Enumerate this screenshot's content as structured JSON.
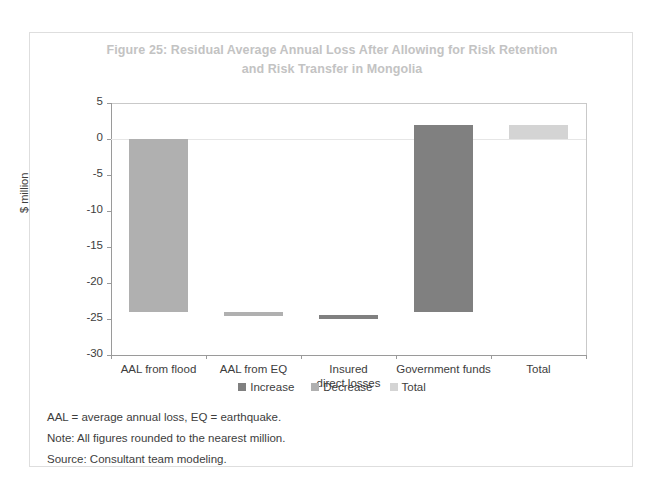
{
  "figure": {
    "title": "Figure 25: Residual Average Annual Loss After Allowing for Risk Retention and Risk Transfer in Mongolia",
    "title_line_1": "Figure 25: Residual Average Annual Loss After Allowing for Risk Retention",
    "title_line_2": "and Risk Transfer in Mongolia"
  },
  "notes": {
    "abbreviations": "AAL = average annual loss, EQ = earthquake.",
    "note": "Note: All figures rounded to the nearest million.",
    "source": "Source: Consultant team modeling."
  },
  "colors": {
    "increase": "#808080",
    "decrease": "#b0b0b0",
    "total": "#d4d4d4",
    "axis": "#9a9a9a",
    "gridline": "#e6e6e6",
    "title": "#c3c3c3",
    "text": "#3d3d3d",
    "frame": "#dedede"
  },
  "chart_data": {
    "type": "bar",
    "chart_style": "waterfall",
    "title": "Figure 25: Residual Average Annual Loss After Allowing for Risk Retention and Risk Transfer in Mongolia",
    "xlabel": "",
    "ylabel": "$ million",
    "ylim": [
      -30,
      5
    ],
    "yticks": [
      5,
      0,
      -5,
      -10,
      -15,
      -20,
      -25,
      -30
    ],
    "ytick_labels": [
      "5",
      "0",
      "-5",
      "-10",
      "-15",
      "-20",
      "-25",
      "-30"
    ],
    "grid": false,
    "legend_position": "bottom",
    "legend": [
      {
        "label": "Increase",
        "color": "#808080"
      },
      {
        "label": "Decrease",
        "color": "#b0b0b0"
      },
      {
        "label": "Total",
        "color": "#d4d4d4"
      }
    ],
    "categories": [
      "AAL from flood",
      "AAL from EQ",
      "Insured direct losses",
      "Government funds",
      "Total"
    ],
    "category_label_lines": [
      [
        "AAL from flood"
      ],
      [
        "AAL from EQ"
      ],
      [
        "Insured",
        "direct losses"
      ],
      [
        "Government funds"
      ],
      [
        "Total"
      ]
    ],
    "bars": [
      {
        "category": "AAL from flood",
        "start": 0,
        "end": -24,
        "delta": -24,
        "series": "Decrease"
      },
      {
        "category": "AAL from EQ",
        "start": -24,
        "end": -24.5,
        "delta": -0.5,
        "series": "Decrease"
      },
      {
        "category": "Insured direct losses",
        "start": -24.5,
        "end": -24.5,
        "delta": 0,
        "series": "Increase"
      },
      {
        "category": "Government funds",
        "start": -24,
        "end": 2,
        "delta": 26,
        "series": "Increase"
      },
      {
        "category": "Total",
        "start": 0,
        "end": 2,
        "delta": 2,
        "series": "Total"
      }
    ],
    "values": [
      -24,
      -0.5,
      0,
      26,
      2
    ]
  }
}
